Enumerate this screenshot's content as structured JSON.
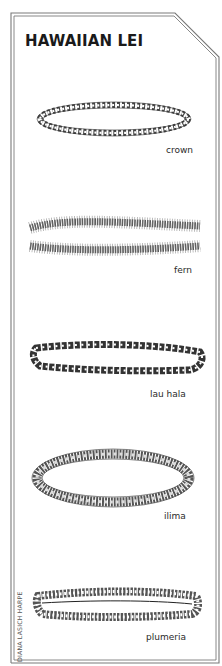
{
  "title": "HAWAIIAN LEI",
  "leis": [
    {
      "name": "crown",
      "label": "crown"
    },
    {
      "name": "fern",
      "label": "fern"
    },
    {
      "name": "lau-hala",
      "label": "lau hala"
    },
    {
      "name": "ilima",
      "label": "ilima"
    },
    {
      "name": "plumeria",
      "label": "plumeria"
    }
  ],
  "credit": "DIANA LASICH HARPE",
  "colors": {
    "border": "#6e6e6e",
    "ink": "#1a1a1a",
    "background": "#ffffff"
  }
}
